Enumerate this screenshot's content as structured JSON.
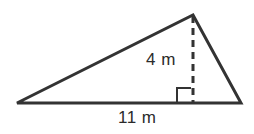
{
  "figure": {
    "kind": "triangle-with-height",
    "background_color": "#ffffff",
    "stroke_color": "#333333",
    "text_color": "#2b2b2b",
    "labels": {
      "height": "4 m",
      "base": "11 m"
    },
    "measurements": {
      "height_value": 4,
      "height_unit": "m",
      "base_value": 11,
      "base_unit": "m"
    },
    "geometry": {
      "left_vertex": {
        "x": 17,
        "y": 103
      },
      "right_vertex": {
        "x": 241,
        "y": 103
      },
      "apex": {
        "x": 193,
        "y": 15
      },
      "foot_of_altitude": {
        "x": 193,
        "y": 103
      },
      "right_angle_marker": {
        "x": 177,
        "y": 88,
        "size": 15
      },
      "altitude_dash_pattern": "7 5",
      "outline_stroke_width": 3,
      "altitude_stroke_width": 3,
      "right_angle_stroke_width": 2
    }
  }
}
